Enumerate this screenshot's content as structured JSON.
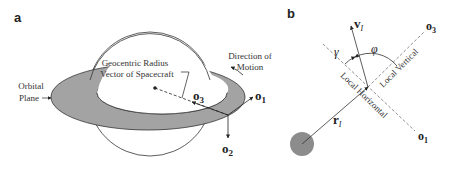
{
  "panel_a": {
    "label": "a",
    "orbital_plane_label_line1": "Orbital",
    "orbital_plane_label_line2": "Plane",
    "radius_label_line1": "Geocentric Radius",
    "radius_label_line2": "Vector of Spacecraft",
    "motion_label_line1": "Direction of",
    "motion_label_line2": "Motion",
    "o1": "o",
    "o1_sub": "1",
    "o2": "o",
    "o2_sub": "2",
    "o3": "o",
    "o3_sub": "3"
  },
  "panel_b": {
    "label": "b",
    "v": "v",
    "v_sub": "I",
    "r": "r",
    "r_sub": "I",
    "gamma": "γ",
    "phi": "φ",
    "local_vertical": "Local Vertical",
    "local_horizontal": "Local Horizontal",
    "o1": "o",
    "o1_sub": "1",
    "o3": "o",
    "o3_sub": "3"
  },
  "colors": {
    "plane_fill": "#a3a3a3",
    "planet_fill": "#8c8c8c",
    "line": "#222222"
  }
}
